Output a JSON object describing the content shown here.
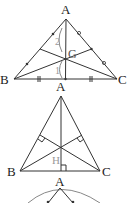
{
  "figure1": {
    "title": "centroid",
    "vertices": {
      "A": "A",
      "B": "B",
      "C": "C"
    },
    "centroid_label": "G",
    "ratio_labels": [
      "2",
      "1"
    ]
  },
  "figure2": {
    "title": "orthocenter",
    "vertices": {
      "A": "A",
      "B": "B",
      "C": "C"
    },
    "orthocenter_label": "H"
  },
  "figure3": {
    "vertices": {
      "A": "A"
    }
  }
}
